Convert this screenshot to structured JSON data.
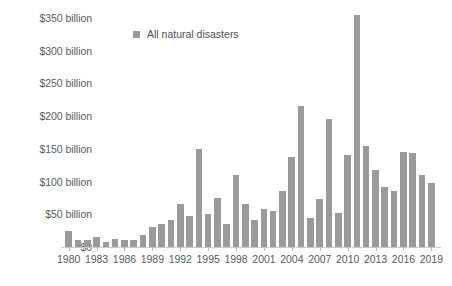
{
  "chart_data": {
    "type": "bar",
    "title": "",
    "subtitle": "",
    "xlabel": "",
    "ylabel": "",
    "ylim": [
      0,
      365
    ],
    "xlim": [
      1980,
      2019
    ],
    "grid": false,
    "legend_position": "top-center",
    "bar_color": "#9a9a9a",
    "axis_color": "#c9cccf",
    "text_color": "#555b60",
    "y_ticks": [
      0,
      50,
      100,
      150,
      200,
      250,
      300,
      350
    ],
    "y_tick_labels": [
      "$0",
      "$50 billion",
      "$100 billion",
      "$150 billion",
      "$200 billion",
      "$250 billion",
      "$300 billion",
      "$350 billion"
    ],
    "x_tick_labels": [
      "1980",
      "1983",
      "1986",
      "1989",
      "1992",
      "1995",
      "1998",
      "2001",
      "2004",
      "2007",
      "2010",
      "2013",
      "2016",
      "2019"
    ],
    "legend": [
      {
        "name": "All natural disasters",
        "color": "#9a9a9a"
      }
    ],
    "categories": [
      "1980",
      "1981",
      "1982",
      "1983",
      "1984",
      "1985",
      "1986",
      "1987",
      "1988",
      "1989",
      "1990",
      "1991",
      "1992",
      "1993",
      "1994",
      "1995",
      "1996",
      "1997",
      "1998",
      "1999",
      "2000",
      "2001",
      "2002",
      "2003",
      "2004",
      "2005",
      "2006",
      "2007",
      "2008",
      "2009",
      "2010",
      "2011",
      "2012",
      "2013",
      "2014",
      "2015",
      "2016",
      "2017",
      "2018",
      "2019"
    ],
    "series": [
      {
        "name": "All natural disasters",
        "values": [
          25,
          10,
          10,
          15,
          8,
          13,
          10,
          10,
          18,
          30,
          35,
          42,
          65,
          48,
          150,
          50,
          75,
          35,
          110,
          65,
          42,
          58,
          55,
          85,
          138,
          215,
          45,
          73,
          195,
          52,
          140,
          355,
          155,
          118,
          92,
          85,
          145,
          143,
          110,
          98
        ]
      }
    ]
  }
}
